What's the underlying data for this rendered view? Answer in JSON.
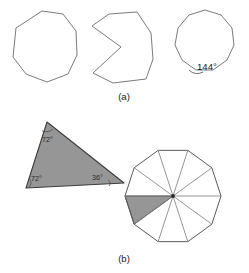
{
  "figure": {
    "width": 249,
    "height": 273,
    "background_color": "#ffffff",
    "stroke_color": "#6b6b6b",
    "shade_color": "#969696",
    "panels": [
      {
        "id": "a",
        "label": "(a)",
        "label_position": {
          "x": 124,
          "y": 100
        },
        "shapes": [
          {
            "name": "convex-nonagon",
            "type": "polygon",
            "shaded": false,
            "points": "42,11 63,14 76,31 77,55 68,74 47,82 26,74 13,57 16,28"
          },
          {
            "name": "concave-notched-polygon",
            "type": "polygon",
            "shaded": false,
            "points": "137,12 151,33 153,59 146,79 113,83 93,73 121,47 92,26 109,14"
          },
          {
            "name": "regular-decagon-with-angle",
            "type": "polygon",
            "shaded": false,
            "points": "205,10 221,15 232,28 234,45 227,60 213,70 196,70 182,60 175,45 178,28 189,15"
          }
        ],
        "angle_annotations": [
          {
            "name": "interior-angle-144",
            "value": "144°",
            "x": 198,
            "y": 70
          }
        ]
      },
      {
        "id": "b",
        "label": "(b)",
        "label_position": {
          "x": 124,
          "y": 262
        },
        "shapes": [
          {
            "name": "isosceles-triangle-shaded",
            "type": "polygon",
            "shaded": true,
            "points": "47,122 124,183 26,188"
          },
          {
            "name": "decagon-dissected-into-ten-triangles",
            "type": "polygon",
            "shaded": false,
            "sides": 10,
            "center": {
              "x": 173,
              "y": 196
            },
            "radius": 48,
            "shaded_wedge_index": 6
          }
        ],
        "angle_annotations": [
          {
            "name": "triangle-apex-angle",
            "value": "72°",
            "x": 46,
            "y": 140
          },
          {
            "name": "triangle-base-left-angle",
            "value": "72°",
            "x": 33,
            "y": 180
          },
          {
            "name": "triangle-base-right-angle",
            "value": "36°",
            "x": 97,
            "y": 179
          }
        ]
      }
    ]
  }
}
